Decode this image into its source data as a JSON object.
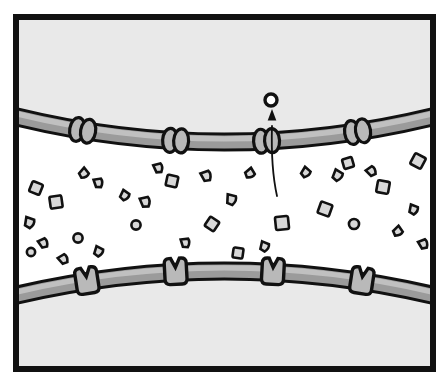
{
  "figure": {
    "caption": "",
    "width": 448,
    "height": 386
  },
  "colors": {
    "ink": "#111111",
    "cell_fill": "#e9e9e9",
    "gap_fill": "#ffffff",
    "membrane_fill": "#9b9b9b",
    "membrane_highlight": "#c0c0c0",
    "protein_fill": "#b9b9b9",
    "particle_fill": "#d8d8d8",
    "page_background": "#ffffff"
  },
  "frame": {
    "name": "panel-border",
    "x": 13,
    "y": 14,
    "width": 423,
    "height": 358,
    "stroke_width": 6
  },
  "regions": [
    {
      "name": "upper-cell-interior",
      "label": "upper cell interior",
      "fill": "#e9e9e9"
    },
    {
      "name": "intercellular-gap",
      "label": "intercellular gap",
      "fill": "#ffffff"
    },
    {
      "name": "lower-cell-interior",
      "label": "lower cell interior",
      "fill": "#e9e9e9"
    }
  ],
  "membranes": [
    {
      "name": "upper-membrane",
      "label": "upper cell membrane",
      "curve": "M 13 116 Q 224 168 436 116",
      "thickness": 13,
      "stroke_width": 3
    },
    {
      "name": "lower-membrane",
      "label": "lower cell membrane",
      "curve": "M 13 296 Q 224 246 436 296",
      "thickness": 13,
      "stroke_width": 3
    }
  ],
  "upper_membrane_proteins": {
    "label": "paired channel proteins",
    "shape": "ellipse-pair",
    "rx": 7.5,
    "ry": 12,
    "pair_gap": 11,
    "items": [
      {
        "name": "protein-pair-1",
        "t": 0.165
      },
      {
        "name": "protein-pair-2",
        "t": 0.385
      },
      {
        "name": "protein-pair-3",
        "t": 0.6
      },
      {
        "name": "protein-pair-4",
        "t": 0.815
      }
    ]
  },
  "lower_membrane_proteins": {
    "label": "notched receptor proteins",
    "shape": "notched-cup",
    "width": 22,
    "height": 26,
    "notch_depth": 9,
    "items": [
      {
        "name": "receptor-1",
        "t": 0.175
      },
      {
        "name": "receptor-2",
        "t": 0.385
      },
      {
        "name": "receptor-3",
        "t": 0.615
      },
      {
        "name": "receptor-4",
        "t": 0.825
      }
    ]
  },
  "particles": {
    "label": "solute particles in intercellular gap",
    "count": 34,
    "items": [
      {
        "name": "particle-square",
        "kind": "square",
        "x": 36,
        "y": 188,
        "size": 11,
        "rot": 22
      },
      {
        "name": "particle-square",
        "kind": "square",
        "x": 56,
        "y": 202,
        "size": 12,
        "rot": -8
      },
      {
        "name": "particle-drop",
        "kind": "drop",
        "x": 30,
        "y": 223,
        "size": 10,
        "rot": 14
      },
      {
        "name": "particle-drop",
        "kind": "drop",
        "x": 44,
        "y": 243,
        "size": 9,
        "rot": -30
      },
      {
        "name": "particle-circle",
        "kind": "circle",
        "x": 78,
        "y": 238,
        "size": 10,
        "rot": 0
      },
      {
        "name": "particle-drop",
        "kind": "drop",
        "x": 84,
        "y": 174,
        "size": 9,
        "rot": 46
      },
      {
        "name": "particle-drop",
        "kind": "drop",
        "x": 99,
        "y": 183,
        "size": 9,
        "rot": -14
      },
      {
        "name": "particle-drop",
        "kind": "drop",
        "x": 125,
        "y": 196,
        "size": 9,
        "rot": 30
      },
      {
        "name": "particle-drop",
        "kind": "drop",
        "x": 146,
        "y": 202,
        "size": 10,
        "rot": -18
      },
      {
        "name": "particle-circle",
        "kind": "circle",
        "x": 136,
        "y": 225,
        "size": 10,
        "rot": 0
      },
      {
        "name": "particle-square",
        "kind": "square",
        "x": 172,
        "y": 181,
        "size": 11,
        "rot": 12
      },
      {
        "name": "particle-square",
        "kind": "square",
        "x": 212,
        "y": 224,
        "size": 11,
        "rot": 34
      },
      {
        "name": "particle-drop",
        "kind": "drop",
        "x": 232,
        "y": 200,
        "size": 10,
        "rot": 8
      },
      {
        "name": "particle-drop",
        "kind": "drop",
        "x": 207,
        "y": 176,
        "size": 10,
        "rot": -24
      },
      {
        "name": "particle-square",
        "kind": "square",
        "x": 282,
        "y": 223,
        "size": 13,
        "rot": -6
      },
      {
        "name": "particle-drop",
        "kind": "drop",
        "x": 250,
        "y": 174,
        "size": 9,
        "rot": 54
      },
      {
        "name": "particle-drop",
        "kind": "drop",
        "x": 338,
        "y": 176,
        "size": 10,
        "rot": 26
      },
      {
        "name": "particle-square",
        "kind": "square",
        "x": 325,
        "y": 209,
        "size": 12,
        "rot": 20
      },
      {
        "name": "particle-circle",
        "kind": "circle",
        "x": 354,
        "y": 224,
        "size": 11,
        "rot": 0
      },
      {
        "name": "particle-drop",
        "kind": "drop",
        "x": 372,
        "y": 171,
        "size": 9,
        "rot": -40
      },
      {
        "name": "particle-square",
        "kind": "square",
        "x": 383,
        "y": 187,
        "size": 12,
        "rot": 10
      },
      {
        "name": "particle-square",
        "kind": "square",
        "x": 418,
        "y": 161,
        "size": 12,
        "rot": 28
      },
      {
        "name": "particle-drop",
        "kind": "drop",
        "x": 414,
        "y": 210,
        "size": 9,
        "rot": 16
      },
      {
        "name": "particle-drop",
        "kind": "drop",
        "x": 424,
        "y": 244,
        "size": 9,
        "rot": -26
      },
      {
        "name": "particle-square",
        "kind": "square",
        "x": 348,
        "y": 163,
        "size": 10,
        "rot": -16
      },
      {
        "name": "particle-drop",
        "kind": "drop",
        "x": 306,
        "y": 173,
        "size": 9,
        "rot": 36
      },
      {
        "name": "particle-drop",
        "kind": "drop",
        "x": 398,
        "y": 232,
        "size": 9,
        "rot": 50
      },
      {
        "name": "particle-drop",
        "kind": "drop",
        "x": 186,
        "y": 243,
        "size": 9,
        "rot": -12
      },
      {
        "name": "particle-drop",
        "kind": "drop",
        "x": 99,
        "y": 252,
        "size": 9,
        "rot": 22
      },
      {
        "name": "particle-drop",
        "kind": "drop",
        "x": 64,
        "y": 259,
        "size": 9,
        "rot": -36
      },
      {
        "name": "particle-circle",
        "kind": "circle",
        "x": 31,
        "y": 252,
        "size": 9,
        "rot": 0
      },
      {
        "name": "particle-drop",
        "kind": "drop",
        "x": 265,
        "y": 247,
        "size": 9,
        "rot": 18
      },
      {
        "name": "particle-drop",
        "kind": "drop",
        "x": 159,
        "y": 168,
        "size": 9,
        "rot": -20
      },
      {
        "name": "particle-square",
        "kind": "square",
        "x": 238,
        "y": 253,
        "size": 10,
        "rot": 8
      }
    ]
  },
  "transport": {
    "name": "transport-event",
    "label": "molecule exiting through channel",
    "arrow": {
      "name": "transport-arrow",
      "label": "direction of transport",
      "path": "M 277 196 C 273 178 271 160 272 126",
      "head_x": 272,
      "head_y": 117,
      "head_size": 7
    },
    "cargo": {
      "name": "transported-molecule",
      "label": "transported molecule",
      "x": 271,
      "y": 100,
      "r": 6,
      "stroke_width": 3.4
    }
  }
}
